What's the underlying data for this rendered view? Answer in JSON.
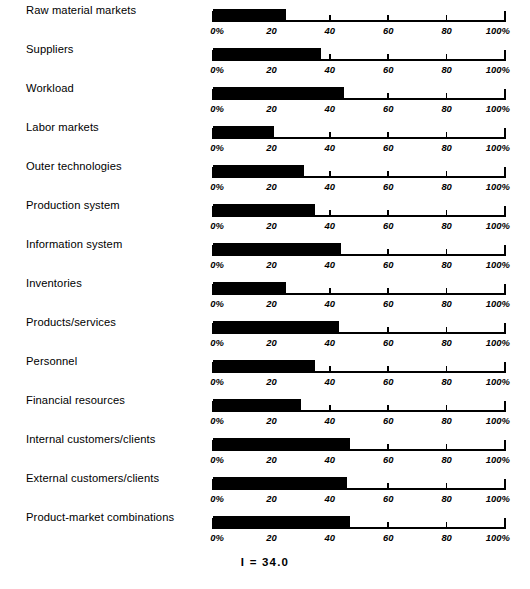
{
  "chart_data": {
    "type": "bar",
    "orientation": "horizontal",
    "title": "",
    "xlabel": "",
    "ylabel": "",
    "xlim": [
      0,
      100
    ],
    "grid": false,
    "legend": null,
    "axis_per_row": true,
    "tick_values": [
      0,
      20,
      40,
      60,
      80,
      100
    ],
    "tick_labels": [
      "0%",
      "20",
      "40",
      "60",
      "80",
      "100%"
    ],
    "categories": [
      "Raw material markets",
      "Suppliers",
      "Workload",
      "Labor markets",
      "Outer technologies",
      "Production system",
      "Information system",
      "Inventories",
      "Products/services",
      "Personnel",
      "Financial resources",
      "Internal customers/clients",
      "External customers/clients",
      "Product-market combinations"
    ],
    "values": [
      25,
      37,
      45,
      21,
      31,
      35,
      44,
      25,
      43,
      35,
      30,
      47,
      46,
      47
    ],
    "annotations": [
      "I  =  34.0"
    ]
  },
  "footer": {
    "summary": "I  =  34.0"
  }
}
